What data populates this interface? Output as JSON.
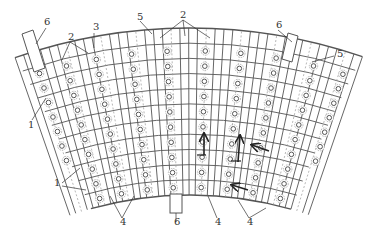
{
  "diagram": {
    "colors": {
      "line": "#555555",
      "dashed": "#999999",
      "arrow": "#222222",
      "label": "#333333"
    },
    "labels": [
      {
        "id": "label-1a",
        "text": "1",
        "x": 28,
        "y": 128
      },
      {
        "id": "label-1b",
        "text": "1",
        "x": 54,
        "y": 186
      },
      {
        "id": "label-2a",
        "text": "2",
        "x": 68,
        "y": 40
      },
      {
        "id": "label-3",
        "text": "3",
        "x": 93,
        "y": 30
      },
      {
        "id": "label-5a",
        "text": "5",
        "x": 137,
        "y": 20
      },
      {
        "id": "label-2b",
        "text": "2",
        "x": 180,
        "y": 18
      },
      {
        "id": "label-6a",
        "text": "6",
        "x": 44,
        "y": 25
      },
      {
        "id": "label-6b",
        "text": "6",
        "x": 276,
        "y": 28
      },
      {
        "id": "label-5b",
        "text": "5",
        "x": 337,
        "y": 57
      },
      {
        "id": "label-4a",
        "text": "4",
        "x": 120,
        "y": 225
      },
      {
        "id": "label-6c",
        "text": "6",
        "x": 174,
        "y": 225
      },
      {
        "id": "label-4b",
        "text": "4",
        "x": 215,
        "y": 225
      },
      {
        "id": "label-4c",
        "text": "4",
        "x": 247,
        "y": 225
      }
    ]
  }
}
